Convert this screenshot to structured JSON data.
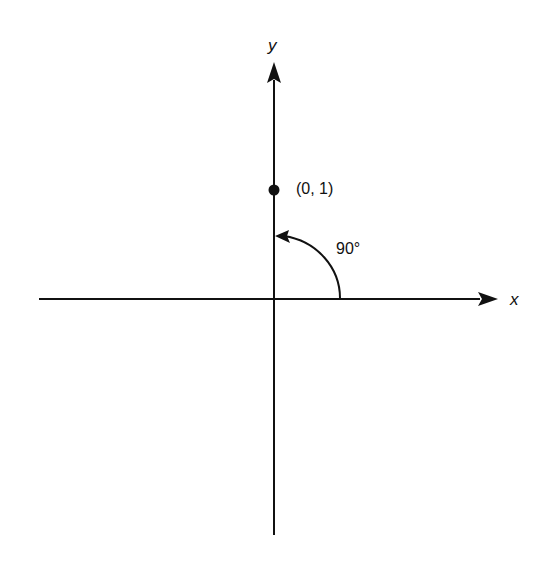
{
  "diagram": {
    "type": "coordinate-plane-rotation",
    "axes": {
      "x_label": "x",
      "y_label": "y"
    },
    "point": {
      "label": "(0, 1)",
      "coords": [
        0,
        1
      ]
    },
    "angle": {
      "label": "90°",
      "degrees": 90,
      "direction": "counterclockwise"
    },
    "colors": {
      "stroke": "#111111",
      "background": "#ffffff"
    }
  }
}
